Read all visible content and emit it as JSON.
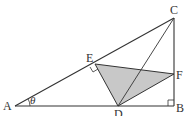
{
  "figure": {
    "type": "geometry",
    "labels": {
      "A": "A",
      "B": "B",
      "C": "C",
      "D": "D",
      "E": "E",
      "F": "F",
      "angle": "θ"
    },
    "points": {
      "A": [
        15,
        106
      ],
      "B": [
        174,
        106
      ],
      "C": [
        174,
        18
      ],
      "D": [
        118,
        106
      ],
      "E": [
        95,
        64
      ],
      "F": [
        174,
        74
      ]
    },
    "shaded_triangle": [
      "D",
      "E",
      "F"
    ],
    "right_angles": [
      "B",
      "E"
    ],
    "colors": {
      "line": "#333333",
      "shade": "#c8c8c8"
    }
  }
}
